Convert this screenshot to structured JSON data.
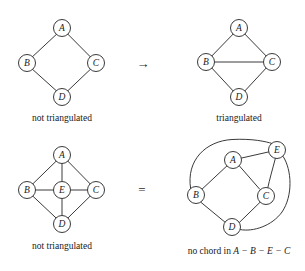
{
  "figure": {
    "edge_color": "#3a3a3a",
    "node_fill": "#ffffff",
    "background": "#ffffff",
    "node_radius": 8.5
  },
  "panels": [
    {
      "id": "top-left",
      "caption": "not triangulated",
      "caption_x": 62,
      "caption_y": 121,
      "nodes": [
        {
          "label": "A",
          "x": 62,
          "y": 28
        },
        {
          "label": "B",
          "x": 27,
          "y": 63
        },
        {
          "label": "C",
          "x": 96,
          "y": 63
        },
        {
          "label": "D",
          "x": 62,
          "y": 97
        }
      ],
      "edges": [
        {
          "from": "A",
          "to": "B"
        },
        {
          "from": "A",
          "to": "C"
        },
        {
          "from": "B",
          "to": "D"
        },
        {
          "from": "C",
          "to": "D"
        }
      ]
    },
    {
      "id": "top-right",
      "caption": "triangulated",
      "caption_x": 239,
      "caption_y": 121,
      "nodes": [
        {
          "label": "A",
          "x": 239,
          "y": 28
        },
        {
          "label": "B",
          "x": 206,
          "y": 62
        },
        {
          "label": "C",
          "x": 272,
          "y": 62
        },
        {
          "label": "D",
          "x": 239,
          "y": 97
        }
      ],
      "edges": [
        {
          "from": "A",
          "to": "B"
        },
        {
          "from": "A",
          "to": "C"
        },
        {
          "from": "B",
          "to": "C"
        },
        {
          "from": "B",
          "to": "D"
        },
        {
          "from": "C",
          "to": "D"
        }
      ]
    },
    {
      "id": "bottom-left",
      "caption": "not triangulated",
      "caption_x": 62,
      "caption_y": 249,
      "nodes": [
        {
          "label": "A",
          "x": 62,
          "y": 155
        },
        {
          "label": "B",
          "x": 27,
          "y": 190
        },
        {
          "label": "E",
          "x": 62,
          "y": 190
        },
        {
          "label": "C",
          "x": 96,
          "y": 190
        },
        {
          "label": "D",
          "x": 62,
          "y": 224
        }
      ],
      "edges": [
        {
          "from": "A",
          "to": "B"
        },
        {
          "from": "A",
          "to": "C"
        },
        {
          "from": "A",
          "to": "E"
        },
        {
          "from": "B",
          "to": "E"
        },
        {
          "from": "E",
          "to": "C"
        },
        {
          "from": "B",
          "to": "D"
        },
        {
          "from": "C",
          "to": "D"
        },
        {
          "from": "E",
          "to": "D"
        }
      ]
    },
    {
      "id": "bottom-right",
      "caption": "no chord in A − B − E − C",
      "caption_x": 239,
      "caption_y": 254,
      "nodes": [
        {
          "label": "A",
          "x": 233,
          "y": 160
        },
        {
          "label": "E",
          "x": 277,
          "y": 150
        },
        {
          "label": "B",
          "x": 196,
          "y": 195
        },
        {
          "label": "C",
          "x": 266,
          "y": 196
        },
        {
          "label": "D",
          "x": 232,
          "y": 227
        }
      ],
      "edges": [
        {
          "from": "A",
          "to": "E",
          "type": "straight"
        },
        {
          "from": "A",
          "to": "B",
          "type": "straight"
        },
        {
          "from": "A",
          "to": "C",
          "type": "straight"
        },
        {
          "from": "B",
          "to": "D",
          "type": "straight"
        },
        {
          "from": "C",
          "to": "D",
          "type": "straight"
        },
        {
          "from": "B",
          "to": "E",
          "type": "arc-over-top"
        },
        {
          "from": "E",
          "to": "C",
          "type": "arc-right-inner"
        },
        {
          "from": "E",
          "to": "D",
          "type": "arc-right-outer"
        }
      ]
    }
  ],
  "operators": [
    {
      "symbol": "→",
      "name": "arrow-right",
      "x": 143,
      "y": 63
    },
    {
      "symbol": "=",
      "name": "equals",
      "x": 142,
      "y": 189
    }
  ],
  "cycle_caption_parts": {
    "prefix": "no chord in ",
    "cycle": "A − B − E − C"
  }
}
